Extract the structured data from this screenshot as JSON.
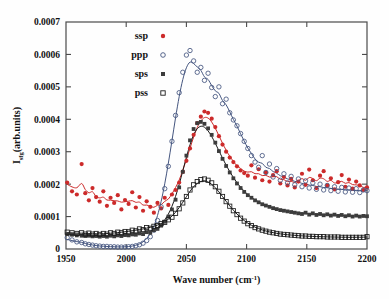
{
  "figure": {
    "background": "#fefefe",
    "frame_color": "#4a4a4a"
  },
  "axes": {
    "x": {
      "label_main": "Wave number (cm",
      "label_unit_sup": "-1",
      "label_tail": ")",
      "label_full": "Wave number (cm^-1)",
      "min": 1950,
      "max": 2200,
      "ticks": [
        1950,
        2000,
        2050,
        2100,
        2150,
        2200
      ],
      "tick_labels": [
        "1950",
        "2000",
        "2050",
        "2100",
        "2150",
        "2200"
      ]
    },
    "y": {
      "label_prefix": "I",
      "label_sub": "sfg",
      "label_suffix": "(arb.units)",
      "label_full": "I_sfg(arb.units)",
      "min": 0,
      "max": 0.0007,
      "ticks": [
        0,
        0.0001,
        0.0002,
        0.0003,
        0.0004,
        0.0005,
        0.0006,
        0.0007
      ],
      "tick_labels": [
        "0",
        "0.0001",
        "0.0002",
        "0.0003",
        "0.0004",
        "0.0005",
        "0.0006",
        "0.0007"
      ]
    }
  },
  "legend": {
    "position": "top-left-inside",
    "entries": [
      {
        "label": "ssp",
        "marker": "filled-circle",
        "color": "#cc2a2a"
      },
      {
        "label": "ppp",
        "marker": "open-circle",
        "color": "#44557f"
      },
      {
        "label": "sps",
        "marker": "filled-square",
        "color": "#3c3c3c"
      },
      {
        "label": "pss",
        "marker": "open-square",
        "color": "#1a1a1a"
      }
    ]
  },
  "chart_data": {
    "type": "scatter",
    "title": "",
    "xlabel": "Wave number (cm^-1)",
    "ylabel": "I_sfg(arb.units)",
    "xlim": [
      1950,
      2200
    ],
    "ylim": [
      0,
      0.0007
    ],
    "grid": false,
    "legend_position": "upper-left-inside",
    "series": [
      {
        "name": "ssp",
        "marker": "filled-circle",
        "color": "#cc2a2a",
        "fit_color": "#cc2a2a",
        "peak_x": 2068,
        "peak_y": 0.00042,
        "baseline": 0.00015,
        "x": [
          1951,
          1955,
          1959,
          1963,
          1966,
          1969,
          1972,
          1975,
          1978,
          1981,
          1984,
          1987,
          1990,
          1993,
          1996,
          1999,
          2002,
          2005,
          2008,
          2011,
          2014,
          2017,
          2020,
          2023,
          2026,
          2029,
          2032,
          2035,
          2038,
          2041,
          2044,
          2047,
          2050,
          2053,
          2056,
          2059,
          2062,
          2065,
          2068,
          2071,
          2074,
          2077,
          2080,
          2083,
          2086,
          2089,
          2092,
          2095,
          2098,
          2101,
          2104,
          2107,
          2110,
          2113,
          2116,
          2119,
          2122,
          2125,
          2128,
          2131,
          2134,
          2137,
          2140,
          2143,
          2146,
          2149,
          2152,
          2155,
          2158,
          2161,
          2164,
          2167,
          2170,
          2173,
          2176,
          2179,
          2182,
          2185,
          2188,
          2191,
          2194,
          2197,
          2200
        ],
        "y": [
          0.000205,
          0.000178,
          0.000168,
          0.000262,
          0.000172,
          0.00015,
          0.000188,
          0.00016,
          0.000146,
          0.000178,
          0.000133,
          0.000158,
          0.000142,
          0.000166,
          0.000122,
          0.000151,
          0.000139,
          0.000175,
          0.000128,
          0.00016,
          0.000118,
          0.000147,
          0.00013,
          0.000112,
          0.000142,
          0.000125,
          0.000158,
          0.000136,
          0.000168,
          0.000182,
          0.000205,
          0.000238,
          0.000272,
          0.00031,
          0.000352,
          0.000388,
          0.000408,
          0.000424,
          0.00042,
          0.000402,
          0.000376,
          0.000348,
          0.000322,
          0.0003,
          0.000282,
          0.000268,
          0.000255,
          0.000242,
          0.000234,
          0.000226,
          0.000258,
          0.00022,
          0.000246,
          0.000212,
          0.000236,
          0.000208,
          0.000228,
          0.00024,
          0.000202,
          0.000222,
          0.000196,
          0.000216,
          0.00019,
          0.000208,
          0.000232,
          0.000198,
          0.000245,
          0.000212,
          0.000188,
          0.000226,
          0.00024,
          0.000196,
          0.000218,
          0.000184,
          0.000206,
          0.000228,
          0.000192,
          0.000214,
          0.000186,
          0.000208,
          0.000196,
          0.000182,
          0.00019
        ]
      },
      {
        "name": "ppp",
        "marker": "open-circle",
        "color": "#44557f",
        "fit_color": "#44557f",
        "peak_x": 2072,
        "peak_y": 0.00055,
        "baseline": 1.5e-05,
        "x": [
          1951,
          1955,
          1959,
          1963,
          1966,
          1969,
          1972,
          1975,
          1978,
          1981,
          1984,
          1987,
          1990,
          1993,
          1996,
          1999,
          2002,
          2005,
          2008,
          2011,
          2014,
          2017,
          2020,
          2023,
          2026,
          2029,
          2032,
          2035,
          2038,
          2041,
          2044,
          2047,
          2050,
          2053,
          2056,
          2059,
          2062,
          2065,
          2068,
          2071,
          2074,
          2077,
          2080,
          2083,
          2086,
          2089,
          2092,
          2095,
          2098,
          2101,
          2104,
          2107,
          2110,
          2113,
          2116,
          2119,
          2122,
          2125,
          2128,
          2131,
          2134,
          2137,
          2140,
          2143,
          2146,
          2149,
          2152,
          2155,
          2158,
          2161,
          2164,
          2167,
          2170,
          2173,
          2176,
          2179,
          2182,
          2185,
          2188,
          2191,
          2194,
          2197,
          2200
        ],
        "y": [
          3.5e-05,
          2.8e-05,
          2.2e-05,
          2e-05,
          1.6e-05,
          1.4e-05,
          1.2e-05,
          1e-05,
          9e-06,
          8e-06,
          8e-06,
          7e-06,
          7e-06,
          6e-06,
          6e-06,
          6e-06,
          7e-06,
          8e-06,
          1e-05,
          1.3e-05,
          1.8e-05,
          2.6e-05,
          3.8e-05,
          5.8e-05,
          8.8e-05,
          0.00013,
          0.000186,
          0.000255,
          0.000332,
          0.000412,
          0.000482,
          0.000545,
          0.000598,
          0.000612,
          0.00058,
          0.000545,
          0.00056,
          0.00052,
          0.000542,
          0.000498,
          0.00047,
          0.0005,
          0.000448,
          0.000462,
          0.00042,
          0.000398,
          0.00038,
          0.000356,
          0.000332,
          0.00031,
          0.000288,
          0.000268,
          0.000252,
          0.000288,
          0.000236,
          0.000262,
          0.000222,
          0.000248,
          0.000212,
          0.000232,
          0.000204,
          0.000224,
          0.000198,
          0.000216,
          0.000192,
          0.00021,
          0.000188,
          0.000204,
          0.000184,
          0.0002,
          0.000182,
          0.000196,
          0.00018,
          0.000192,
          0.000178,
          0.00019,
          0.000176,
          0.000188,
          0.000175,
          0.000186,
          0.000174,
          0.000182,
          0.00018
        ]
      },
      {
        "name": "sps",
        "marker": "filled-square",
        "color": "#3c3c3c",
        "fit_color": "#1a1a1a",
        "peak_x": 2066,
        "peak_y": 0.00039,
        "baseline": 4e-05,
        "x": [
          1951,
          1955,
          1959,
          1963,
          1966,
          1969,
          1972,
          1975,
          1978,
          1981,
          1984,
          1987,
          1990,
          1993,
          1996,
          1999,
          2002,
          2005,
          2008,
          2011,
          2014,
          2017,
          2020,
          2023,
          2026,
          2029,
          2032,
          2035,
          2038,
          2041,
          2044,
          2047,
          2050,
          2053,
          2056,
          2059,
          2062,
          2065,
          2068,
          2071,
          2074,
          2077,
          2080,
          2083,
          2086,
          2089,
          2092,
          2095,
          2098,
          2101,
          2104,
          2107,
          2110,
          2113,
          2116,
          2119,
          2122,
          2125,
          2128,
          2131,
          2134,
          2137,
          2140,
          2143,
          2146,
          2149,
          2152,
          2155,
          2158,
          2161,
          2164,
          2167,
          2170,
          2173,
          2176,
          2179,
          2182,
          2185,
          2188,
          2191,
          2194,
          2197,
          2200
        ],
        "y": [
          4.6e-05,
          4.4e-05,
          4.2e-05,
          4.1e-05,
          4e-05,
          4.1e-05,
          3.9e-05,
          4e-05,
          3.8e-05,
          4e-05,
          3.8e-05,
          4.1e-05,
          3.9e-05,
          4.2e-05,
          4e-05,
          4.3e-05,
          4.2e-05,
          4.5e-05,
          4.4e-05,
          4.8e-05,
          4.6e-05,
          5.2e-05,
          5e-05,
          5.8e-05,
          6.2e-05,
          7.2e-05,
          8.4e-05,
          0.0001,
          0.000122,
          0.000152,
          0.00019,
          0.000238,
          0.000288,
          0.000335,
          0.00037,
          0.000388,
          0.000392,
          0.000386,
          0.000372,
          0.000352,
          0.000328,
          0.000302,
          0.000278,
          0.000256,
          0.000236,
          0.000218,
          0.000202,
          0.000188,
          0.000176,
          0.000166,
          0.000158,
          0.00015,
          0.000144,
          0.000138,
          0.000134,
          0.00013,
          0.000126,
          0.000123,
          0.00012,
          0.000118,
          0.000116,
          0.000114,
          0.000112,
          0.00011,
          0.000108,
          0.000112,
          0.000106,
          0.00011,
          0.000105,
          0.000108,
          0.000104,
          0.000107,
          0.000103,
          0.000106,
          0.000102,
          0.000105,
          0.000101,
          0.000104,
          0.0001,
          0.000103,
          0.0001,
          0.000102,
          0.000101
        ]
      },
      {
        "name": "pss",
        "marker": "open-square",
        "color": "#1a1a1a",
        "fit_color": "#1a1a1a",
        "peak_x": 2074,
        "peak_y": 0.000215,
        "baseline": 3e-05,
        "x": [
          1951,
          1955,
          1959,
          1963,
          1966,
          1969,
          1972,
          1975,
          1978,
          1981,
          1984,
          1987,
          1990,
          1993,
          1996,
          1999,
          2002,
          2005,
          2008,
          2011,
          2014,
          2017,
          2020,
          2023,
          2026,
          2029,
          2032,
          2035,
          2038,
          2041,
          2044,
          2047,
          2050,
          2053,
          2056,
          2059,
          2062,
          2065,
          2068,
          2071,
          2074,
          2077,
          2080,
          2083,
          2086,
          2089,
          2092,
          2095,
          2098,
          2101,
          2104,
          2107,
          2110,
          2113,
          2116,
          2119,
          2122,
          2125,
          2128,
          2131,
          2134,
          2137,
          2140,
          2143,
          2146,
          2149,
          2152,
          2155,
          2158,
          2161,
          2164,
          2167,
          2170,
          2173,
          2176,
          2179,
          2182,
          2185,
          2188,
          2191,
          2194,
          2197,
          2200
        ],
        "y": [
          5.2e-05,
          5e-05,
          4.8e-05,
          5e-05,
          4.6e-05,
          4.9e-05,
          4.6e-05,
          4.8e-05,
          4.5e-05,
          4.8e-05,
          4.6e-05,
          5e-05,
          4.8e-05,
          5.2e-05,
          5e-05,
          5.4e-05,
          5.3e-05,
          5.8e-05,
          5.6e-05,
          6.2e-05,
          6e-05,
          6.6e-05,
          6.4e-05,
          7e-05,
          7.2e-05,
          7.8e-05,
          8.2e-05,
          9e-05,
          9.8e-05,
          0.00011,
          0.000124,
          0.000142,
          0.000162,
          0.000182,
          0.000198,
          0.000208,
          0.000214,
          0.000216,
          0.000212,
          0.000204,
          0.000192,
          0.000178,
          0.000162,
          0.000146,
          0.000132,
          0.000118,
          0.000106,
          9.5e-05,
          8.6e-05,
          7.8e-05,
          7.2e-05,
          6.6e-05,
          6.2e-05,
          5.8e-05,
          5.5e-05,
          5.2e-05,
          5e-05,
          4.8e-05,
          4.6e-05,
          4.5e-05,
          4.4e-05,
          4.3e-05,
          4.2e-05,
          4.1e-05,
          4e-05,
          4e-05,
          3.9e-05,
          3.9e-05,
          3.8e-05,
          3.8e-05,
          3.8e-05,
          3.7e-05,
          3.7e-05,
          3.7e-05,
          3.7e-05,
          3.6e-05,
          3.6e-05,
          3.6e-05,
          3.6e-05,
          3.6e-05,
          3.6e-05,
          3.6e-05,
          3.8e-05
        ]
      }
    ]
  }
}
